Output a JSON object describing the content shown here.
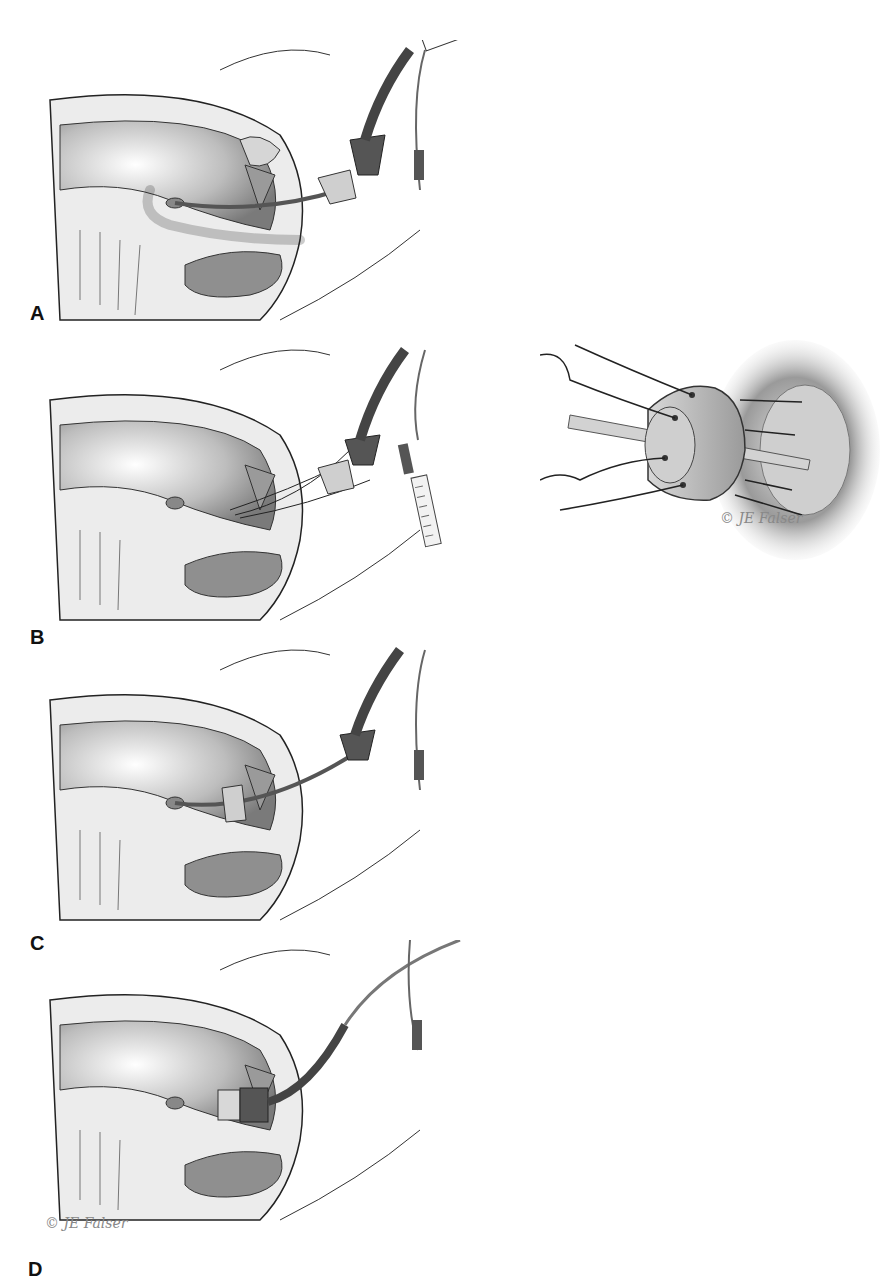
{
  "figure": {
    "panels": [
      {
        "id": "A",
        "label": "A",
        "device": "catheter with balloon, cervical cup and proximal connector"
      },
      {
        "id": "B",
        "label": "B",
        "device": "catheter with cervical cup, sutures and syringe"
      },
      {
        "id": "C",
        "label": "C",
        "device": "cervical cup advanced to cervix"
      },
      {
        "id": "D",
        "label": "D",
        "device": "catheter secured with tubing"
      }
    ],
    "inset": {
      "description": "close-up of cervical cup with sutures passing through holes into cervix"
    },
    "signature": {
      "text": "© JE Falser",
      "mark": "©"
    }
  },
  "colors": {
    "background": "#ffffff",
    "outline": "#222222",
    "tissue_light": "#e6e6e6",
    "tissue_mid": "#bdbdbd",
    "tissue_dark": "#7a7a7a",
    "device_dark": "#4a4a4a",
    "device_light": "#d9d9d9"
  }
}
